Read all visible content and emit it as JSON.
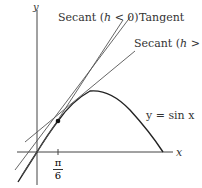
{
  "figure": {
    "axes": {
      "x_label": "x",
      "y_label": "y"
    },
    "tick": {
      "numerator": "π",
      "denominator": "6"
    },
    "labels": {
      "secant_neg": {
        "prefix": "Secant (",
        "var": "h",
        "suffix": " < 0)"
      },
      "tangent": "Tangent",
      "secant_pos": {
        "prefix": "Secant (",
        "var": "h",
        "suffix": " > 0)"
      },
      "curve": "y = sin x"
    },
    "colors": {
      "line": "#333333",
      "curve": "#222222"
    }
  }
}
